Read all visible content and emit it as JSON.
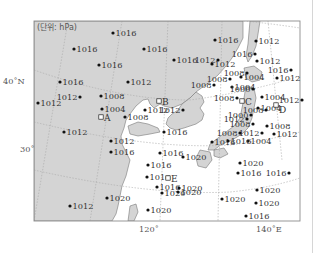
{
  "unit_label": "(단위: hPa)",
  "axes": {
    "lat_labels": [
      {
        "text": "40˚N"
      },
      {
        "text": "30˚"
      }
    ],
    "lon_labels": [
      {
        "text": "120˚"
      },
      {
        "text": "140˚E"
      }
    ]
  },
  "colors": {
    "land": "#d4d4d4",
    "sea": "#ffffff",
    "frame": "#8c8c8c",
    "grid": "#a8a8a8",
    "station": "#111111",
    "text": "#333333"
  },
  "stations": [
    {
      "value": "1016"
    },
    {
      "value": "1016"
    },
    {
      "value": "1016"
    },
    {
      "value": "1016"
    },
    {
      "value": "1016"
    },
    {
      "value": "1016"
    },
    {
      "value": "1012"
    },
    {
      "value": "1016"
    },
    {
      "value": "1012"
    },
    {
      "value": "1012"
    },
    {
      "value": "1016"
    },
    {
      "value": "1012"
    },
    {
      "value": "1012"
    },
    {
      "value": "1008"
    },
    {
      "value": "1008"
    },
    {
      "value": "1012"
    },
    {
      "value": "1016"
    },
    {
      "value": "1012"
    },
    {
      "value": "1008"
    },
    {
      "value": "1004"
    },
    {
      "value": "1012"
    },
    {
      "value": "1008"
    },
    {
      "value": "1004"
    },
    {
      "value": "1004"
    },
    {
      "value": "1008"
    },
    {
      "value": "1000"
    },
    {
      "value": "1004"
    },
    {
      "value": "1012"
    },
    {
      "value": "1012"
    },
    {
      "value": "1016"
    },
    {
      "value": "1012"
    },
    {
      "value": "1004"
    },
    {
      "value": "1008"
    },
    {
      "value": "1008"
    },
    {
      "value": "1000"
    },
    {
      "value": "1008"
    },
    {
      "value": "1004"
    },
    {
      "value": "1012"
    },
    {
      "value": "1008"
    },
    {
      "value": "1012"
    },
    {
      "value": "1008"
    },
    {
      "value": "1012"
    },
    {
      "value": "1012"
    },
    {
      "value": "1012"
    },
    {
      "value": "1016"
    },
    {
      "value": "1016"
    },
    {
      "value": "1016"
    },
    {
      "value": "1016"
    },
    {
      "value": "1016"
    },
    {
      "value": "1016"
    },
    {
      "value": "1020"
    },
    {
      "value": "1020"
    },
    {
      "value": "1016"
    },
    {
      "value": "1016"
    },
    {
      "value": "1016"
    },
    {
      "value": "1020"
    },
    {
      "value": "1020"
    },
    {
      "value": "1020"
    },
    {
      "value": "1020"
    },
    {
      "value": "1020"
    },
    {
      "value": "1020"
    },
    {
      "value": "1020"
    },
    {
      "value": "1020"
    },
    {
      "value": "1016"
    },
    {
      "value": "1012"
    }
  ],
  "points": [
    {
      "label": "A"
    },
    {
      "label": "B"
    },
    {
      "label": "C"
    },
    {
      "label": "D"
    },
    {
      "label": "E"
    }
  ]
}
